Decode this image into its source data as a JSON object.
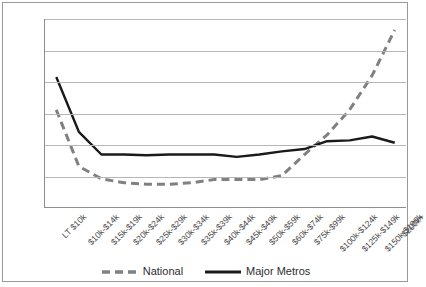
{
  "chart_data": {
    "type": "line",
    "title": "",
    "xlabel": "",
    "ylabel": "",
    "ylim": [
      0.6,
      1.8
    ],
    "yticks": [
      "1.8",
      "1.6",
      "1.4",
      "1.2",
      "1",
      "0.8",
      "0.6"
    ],
    "ytick_values": [
      1.8,
      1.6,
      1.4,
      1.2,
      1.0,
      0.8,
      0.6
    ],
    "grid": true,
    "legend_position": "bottom",
    "categories": [
      "LT $10k",
      "$10k-$14k",
      "$15k-$19k",
      "$20k-$24k",
      "$25k-$29k",
      "$30k-$34k",
      "$35k-$39k",
      "$40k-$44k",
      "$45k-$49k",
      "$50k-$59k",
      "$60k-$74k",
      "$75k-$99k",
      "$100k-$124k",
      "$125k-$149k",
      "$150k-$199k",
      "$200k+"
    ],
    "series": [
      {
        "name": "National",
        "style": "dashed",
        "color": "#808080",
        "values": [
          1.22,
          0.86,
          0.78,
          0.755,
          0.745,
          0.745,
          0.755,
          0.775,
          0.775,
          0.775,
          0.8,
          0.935,
          1.06,
          1.22,
          1.44,
          1.73
        ]
      },
      {
        "name": "Major Metros",
        "style": "solid",
        "color": "#1a1a1a",
        "values": [
          1.43,
          1.08,
          0.935,
          0.935,
          0.93,
          0.935,
          0.935,
          0.935,
          0.92,
          0.935,
          0.955,
          0.97,
          1.02,
          1.025,
          1.05,
          1.01
        ]
      }
    ]
  },
  "legend": {
    "items": [
      {
        "label": "National",
        "style": "dashed"
      },
      {
        "label": "Major Metros",
        "style": "solid"
      }
    ]
  }
}
